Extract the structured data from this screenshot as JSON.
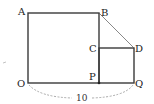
{
  "diagram": {
    "points": {
      "A": {
        "label": "A",
        "x": 28,
        "y": 13
      },
      "B": {
        "label": "B",
        "x": 99,
        "y": 13
      },
      "C": {
        "label": "C",
        "x": 99,
        "y": 48
      },
      "D": {
        "label": "D",
        "x": 134,
        "y": 48
      },
      "O": {
        "label": "O",
        "x": 28,
        "y": 83
      },
      "P": {
        "label": "P",
        "x": 99,
        "y": 83
      },
      "Q": {
        "label": "Q",
        "x": 134,
        "y": 83
      }
    },
    "dimension_label": "10",
    "colors": {
      "stroke": "#3a3a3a",
      "dashed": "#888888",
      "text": "#222222"
    }
  }
}
